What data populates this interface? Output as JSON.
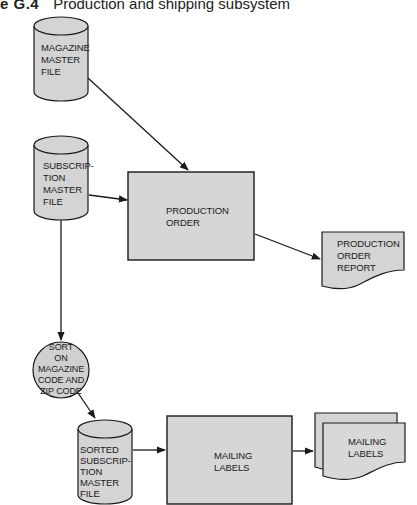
{
  "caption": {
    "number": "e G.4",
    "title": "Production and shipping subsystem"
  },
  "nodes": {
    "magazine_master_file": {
      "type": "file-cylinder",
      "lines": [
        "MAGAZINE",
        "MASTER",
        "FILE"
      ]
    },
    "subscription_master_file": {
      "type": "file-cylinder",
      "lines": [
        "SUBSCRIP-",
        "TION",
        "MASTER",
        "FILE"
      ]
    },
    "production_order": {
      "type": "process-rectangle",
      "lines": [
        "PRODUCTION",
        "ORDER"
      ]
    },
    "production_order_report": {
      "type": "document",
      "lines": [
        "PRODUCTION",
        "ORDER",
        "REPORT"
      ]
    },
    "sort_process": {
      "type": "process-circle",
      "lines": [
        "SORT",
        "ON",
        "MAGAZINE",
        "CODE AND",
        "ZIP CODE"
      ]
    },
    "sorted_subscription_master_file": {
      "type": "file-cylinder",
      "lines": [
        "SORTED",
        "SUBSCRIP-",
        "TION",
        "MASTER",
        "FILE"
      ]
    },
    "mailing_labels_process": {
      "type": "process-rectangle",
      "lines": [
        "MAILING",
        "LABELS"
      ]
    },
    "mailing_labels_output": {
      "type": "multi-document",
      "lines": [
        "MAILING",
        "LABELS"
      ]
    }
  },
  "edges": [
    {
      "from": "MAGAZINE MASTER FILE",
      "to": "PRODUCTION ORDER"
    },
    {
      "from": "SUBSCRIPTION MASTER FILE",
      "to": "PRODUCTION ORDER"
    },
    {
      "from": "PRODUCTION ORDER",
      "to": "PRODUCTION ORDER REPORT"
    },
    {
      "from": "SUBSCRIPTION MASTER FILE",
      "to": "SORT ON MAGAZINE CODE AND ZIP CODE"
    },
    {
      "from": "SORT ON MAGAZINE CODE AND ZIP CODE",
      "to": "SORTED SUBSCRIPTION MASTER FILE"
    },
    {
      "from": "SORTED SUBSCRIPTION MASTER FILE",
      "to": "MAILING LABELS (process)"
    },
    {
      "from": "MAILING LABELS (process)",
      "to": "MAILING LABELS (output)"
    }
  ],
  "colors": {
    "shape_fill": "#d4d4d4",
    "stroke": "#1a1a1a",
    "background": "#ffffff"
  }
}
